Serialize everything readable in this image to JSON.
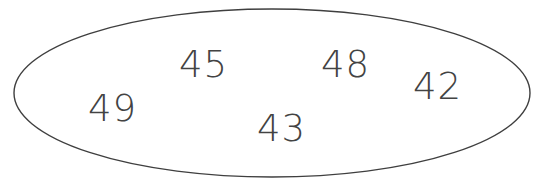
{
  "figure": {
    "type": "set-diagram",
    "background_color": "#ffffff",
    "container": {
      "shape": "ellipse",
      "name": "set-oval",
      "stroke_color": "#3f3f3f",
      "fill_color": "#ffffff",
      "stroke_width": 1.4,
      "center_x": 272,
      "center_y": 93,
      "radius_x": 258,
      "radius_y": 84
    },
    "elements": [
      {
        "value": "49",
        "x": 88,
        "y": 90
      },
      {
        "value": "45",
        "x": 179,
        "y": 46
      },
      {
        "value": "43",
        "x": 257,
        "y": 110
      },
      {
        "value": "48",
        "x": 321,
        "y": 46
      },
      {
        "value": "42",
        "x": 413,
        "y": 68
      }
    ]
  }
}
